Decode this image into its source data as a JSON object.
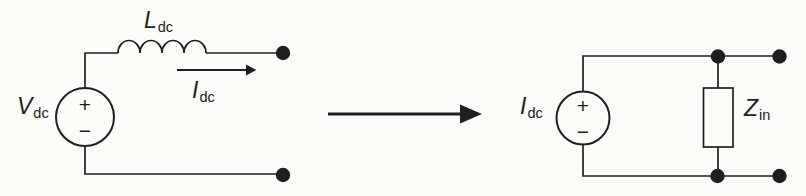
{
  "colors": {
    "paper": "#fbfbf8",
    "ink": "#1f1f1f"
  },
  "left_circuit": {
    "source_label": {
      "base": "V",
      "sub": "dc"
    },
    "source_plus": "+",
    "source_minus": "−",
    "inductor_label": {
      "base": "L",
      "sub": "dc"
    },
    "current_label": {
      "base": "I",
      "sub": "dc"
    }
  },
  "transform": {
    "arrow_icon": "arrow-right"
  },
  "right_circuit": {
    "source_label": {
      "base": "I",
      "sub": "dc"
    },
    "source_plus": "+",
    "source_minus": "−",
    "impedance_label": {
      "base": "Z",
      "sub": "in"
    }
  }
}
